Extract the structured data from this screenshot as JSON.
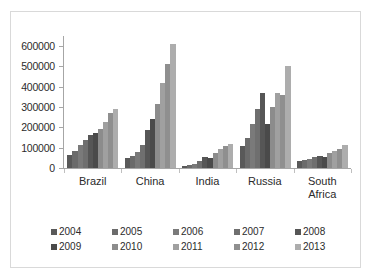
{
  "chart_data": {
    "type": "bar",
    "title": "",
    "xlabel": "",
    "ylabel": "",
    "ylim": [
      0,
      650000
    ],
    "grid": false,
    "legend_position": "bottom",
    "categories": [
      "Brazil",
      "China",
      "India",
      "Russia",
      "South Africa"
    ],
    "yticks": [
      "0",
      "100000",
      "200000",
      "300000",
      "400000",
      "500000",
      "600000"
    ],
    "ytick_values": [
      0,
      100000,
      200000,
      300000,
      400000,
      500000,
      600000
    ],
    "series": [
      {
        "name": "2004",
        "color": "#595959",
        "values": [
          66000,
          47000,
          8000,
          106000,
          35000
        ]
      },
      {
        "name": "2005",
        "color": "#6b6b6b",
        "values": [
          86000,
          60000,
          14000,
          150000,
          38000
        ]
      },
      {
        "name": "2006",
        "color": "#7a7a7a",
        "values": [
          115000,
          78000,
          22000,
          218000,
          46000
        ]
      },
      {
        "name": "2007",
        "color": "#6f6f6f",
        "values": [
          140000,
          115000,
          36000,
          290000,
          54000
        ]
      },
      {
        "name": "2008",
        "color": "#565656",
        "values": [
          165000,
          185000,
          52000,
          368000,
          60000
        ]
      },
      {
        "name": "2009",
        "color": "#4a4a4a",
        "values": [
          170000,
          240000,
          48000,
          218000,
          55000
        ]
      },
      {
        "name": "2010",
        "color": "#8c8c8c",
        "values": [
          190000,
          315000,
          74000,
          300000,
          73000
        ]
      },
      {
        "name": "2011",
        "color": "#a0a0a0",
        "values": [
          225000,
          420000,
          93000,
          368000,
          83000
        ]
      },
      {
        "name": "2012",
        "color": "#8f8f8f",
        "values": [
          270000,
          510000,
          110000,
          358000,
          93000
        ]
      },
      {
        "name": "2013",
        "color": "#adadad",
        "values": [
          292000,
          610000,
          120000,
          500000,
          112000
        ]
      }
    ]
  },
  "legend": {
    "row1": [
      "2004",
      "2005",
      "2006",
      "2007",
      "2008"
    ],
    "row2": [
      "2009",
      "2010",
      "2011",
      "2012",
      "2013"
    ]
  },
  "colors": {
    "axis": "#a6a6a6",
    "text": "#2b2b2b",
    "border": "#d9d9d9",
    "background": "#ffffff"
  }
}
